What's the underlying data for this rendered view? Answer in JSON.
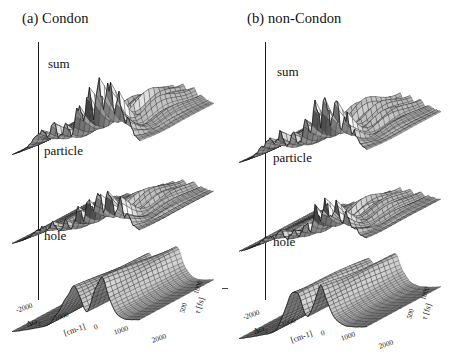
{
  "figure": {
    "background": "#ffffff",
    "ink": "#1a1a1a",
    "separator_glyph": "-"
  },
  "panels": [
    {
      "id": "a",
      "title": "(a) Condon",
      "surfaces": [
        {
          "name": "sum",
          "label": "sum"
        },
        {
          "name": "particle",
          "label": "particle"
        },
        {
          "name": "hole",
          "label": "hole"
        }
      ],
      "x_axis": {
        "symbol": "Δω",
        "subscript": "2",
        "units": "[cm-1]",
        "ticks": [
          "-2000",
          "-1000",
          "0",
          "1000",
          "2000"
        ],
        "range": [
          -2500,
          2500
        ]
      },
      "y_axis": {
        "symbol": "τ",
        "units": "[fs]",
        "ticks": [
          "500",
          "1000"
        ],
        "range": [
          0,
          1200
        ]
      }
    },
    {
      "id": "b",
      "title": "(b) non-Condon",
      "surfaces": [
        {
          "name": "sum",
          "label": "sum"
        },
        {
          "name": "particle",
          "label": "particle"
        },
        {
          "name": "hole",
          "label": "hole"
        }
      ],
      "x_axis": {
        "symbol": "Δω",
        "subscript": "2",
        "units": "[cm-1]",
        "ticks": [
          "-2000",
          "-1000",
          "0",
          "1000",
          "2000"
        ],
        "range": [
          -2500,
          2500
        ]
      },
      "y_axis": {
        "symbol": "τ",
        "units": "[fs]",
        "ticks": [
          "500",
          "1000"
        ],
        "range": [
          0,
          1200
        ]
      }
    }
  ],
  "chart_data": {
    "type": "line",
    "xlabel": "Δω₂ [cm-1]",
    "ylabel": "τ [fs]",
    "zlabel": "signal",
    "xlim": [
      -2500,
      2500
    ],
    "ylim": [
      0,
      1200
    ],
    "grid": false,
    "legend": "none",
    "style": "stacked 3D wireframe mesh surfaces (waterfall), greyscale",
    "xticks": [
      -2000,
      -1000,
      0,
      1000,
      2000
    ],
    "yticks": [
      500,
      1000
    ],
    "x": [
      -2500,
      -2400,
      -2300,
      -2200,
      -2100,
      -2000,
      -1900,
      -1800,
      -1700,
      -1600,
      -1500,
      -1400,
      -1300,
      -1200,
      -1100,
      -1000,
      -900,
      -800,
      -700,
      -600,
      -500,
      -400,
      -300,
      -200,
      -100,
      0,
      100,
      200,
      300,
      400,
      500,
      600,
      700,
      800,
      900,
      1000,
      1100,
      1200,
      1300,
      1400,
      1500,
      1600,
      1700,
      1800,
      1900,
      2000,
      2100,
      2200,
      2300,
      2400,
      2500
    ],
    "panels": [
      {
        "panel": "a",
        "panel_title": "(a) Condon",
        "series": [
          {
            "name": "sum",
            "description": "front trace at tau = 0 fs; sharp vibronic peak progression strongest between -300 and 1500 cm-1",
            "values": [
              0.02,
              0.03,
              0.04,
              0.05,
              0.07,
              0.09,
              0.12,
              0.16,
              0.2,
              0.24,
              0.27,
              0.3,
              0.34,
              0.3,
              0.26,
              0.33,
              0.45,
              0.38,
              0.26,
              0.22,
              0.3,
              0.44,
              0.36,
              0.24,
              0.3,
              0.52,
              0.72,
              0.55,
              0.42,
              0.68,
              0.88,
              0.7,
              0.52,
              0.8,
              0.97,
              0.78,
              0.58,
              0.86,
              1.0,
              0.76,
              0.5,
              0.62,
              0.84,
              0.6,
              0.36,
              0.44,
              0.34,
              0.22,
              0.14,
              0.09,
              0.05
            ]
          },
          {
            "name": "particle",
            "description": "front trace at tau = 0 fs; peaks similar in position to sum but lower amplitude",
            "values": [
              0.02,
              0.02,
              0.03,
              0.04,
              0.05,
              0.07,
              0.09,
              0.12,
              0.16,
              0.19,
              0.22,
              0.25,
              0.28,
              0.25,
              0.21,
              0.27,
              0.37,
              0.31,
              0.21,
              0.18,
              0.25,
              0.37,
              0.3,
              0.2,
              0.25,
              0.44,
              0.61,
              0.47,
              0.36,
              0.58,
              0.75,
              0.6,
              0.44,
              0.68,
              0.82,
              0.66,
              0.49,
              0.73,
              0.85,
              0.64,
              0.42,
              0.52,
              0.71,
              0.51,
              0.31,
              0.37,
              0.28,
              0.18,
              0.12,
              0.07,
              0.04
            ]
          },
          {
            "name": "hole",
            "description": "front trace at tau = 0 fs; smooth broad ridges, three rounded maxima near -150, 600 and 1300 cm-1, flat elsewhere",
            "values": [
              0.01,
              0.01,
              0.01,
              0.01,
              0.02,
              0.02,
              0.02,
              0.03,
              0.03,
              0.04,
              0.04,
              0.05,
              0.05,
              0.06,
              0.08,
              0.12,
              0.18,
              0.26,
              0.34,
              0.42,
              0.52,
              0.62,
              0.72,
              0.8,
              0.86,
              0.84,
              0.72,
              0.55,
              0.38,
              0.28,
              0.34,
              0.5,
              0.68,
              0.84,
              0.95,
              1.0,
              0.92,
              0.74,
              0.54,
              0.38,
              0.26,
              0.18,
              0.12,
              0.08,
              0.05,
              0.04,
              0.03,
              0.02,
              0.02,
              0.01,
              0.01
            ]
          }
        ]
      },
      {
        "panel": "b",
        "panel_title": "(b) non-Condon",
        "series": [
          {
            "name": "sum",
            "description": "front trace at tau = 0 fs; fewer, taller and more isolated peaks than Condon case, max near 900 cm-1",
            "values": [
              0.02,
              0.03,
              0.04,
              0.05,
              0.06,
              0.08,
              0.11,
              0.15,
              0.19,
              0.23,
              0.26,
              0.29,
              0.33,
              0.28,
              0.24,
              0.31,
              0.42,
              0.35,
              0.24,
              0.2,
              0.28,
              0.41,
              0.33,
              0.22,
              0.26,
              0.4,
              0.56,
              0.44,
              0.34,
              0.62,
              0.92,
              0.7,
              0.46,
              0.78,
              1.0,
              0.74,
              0.48,
              0.66,
              0.86,
              0.62,
              0.38,
              0.48,
              0.66,
              0.46,
              0.28,
              0.34,
              0.26,
              0.17,
              0.11,
              0.07,
              0.04
            ]
          },
          {
            "name": "particle",
            "description": "front trace at tau = 0 fs; broad structured band with spike near 900 cm-1",
            "values": [
              0.02,
              0.02,
              0.03,
              0.04,
              0.05,
              0.07,
              0.09,
              0.12,
              0.15,
              0.18,
              0.21,
              0.24,
              0.27,
              0.24,
              0.2,
              0.26,
              0.35,
              0.3,
              0.2,
              0.17,
              0.24,
              0.35,
              0.28,
              0.19,
              0.23,
              0.35,
              0.49,
              0.39,
              0.3,
              0.55,
              0.82,
              0.62,
              0.41,
              0.7,
              0.9,
              0.66,
              0.43,
              0.59,
              0.77,
              0.55,
              0.34,
              0.43,
              0.59,
              0.41,
              0.25,
              0.3,
              0.23,
              0.15,
              0.1,
              0.06,
              0.04
            ]
          },
          {
            "name": "hole",
            "description": "front trace at tau = 0 fs; broad ridges shifted toward positive frequency relative to Condon case",
            "values": [
              0.01,
              0.01,
              0.01,
              0.02,
              0.02,
              0.02,
              0.03,
              0.03,
              0.04,
              0.04,
              0.05,
              0.05,
              0.06,
              0.07,
              0.1,
              0.16,
              0.26,
              0.4,
              0.56,
              0.7,
              0.82,
              0.9,
              0.94,
              0.88,
              0.72,
              0.54,
              0.4,
              0.34,
              0.42,
              0.58,
              0.76,
              0.9,
              1.0,
              0.9,
              0.72,
              0.54,
              0.4,
              0.3,
              0.22,
              0.16,
              0.12,
              0.09,
              0.06,
              0.05,
              0.04,
              0.03,
              0.02,
              0.02,
              0.01,
              0.01,
              0.01
            ]
          }
        ]
      }
    ]
  }
}
